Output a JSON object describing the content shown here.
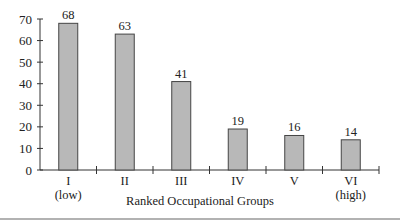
{
  "chart_data": {
    "type": "bar",
    "title": "",
    "xlabel": "Ranked Occupational Groups",
    "ylabel": "",
    "categories": [
      "I",
      "II",
      "III",
      "IV",
      "V",
      "VI"
    ],
    "category_sublabels": [
      "(low)",
      "",
      "",
      "",
      "",
      "(high)"
    ],
    "values": [
      68,
      63,
      41,
      19,
      16,
      14
    ],
    "data_labels": [
      "68",
      "63",
      "41",
      "19",
      "16",
      "14"
    ],
    "ylim": [
      0,
      70
    ],
    "yticks": [
      0,
      10,
      20,
      30,
      40,
      50,
      60,
      70
    ],
    "ytick_labels": [
      "0",
      "10",
      "20",
      "30",
      "40",
      "50",
      "60",
      "70"
    ],
    "grid": false,
    "legend": null,
    "bar_color": "#b8b8b8",
    "bar_edge_color": "#444444"
  }
}
